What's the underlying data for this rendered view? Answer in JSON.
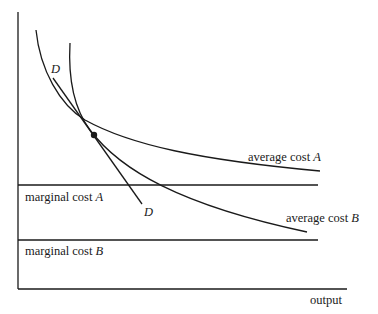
{
  "diagram": {
    "type": "economics cost curves",
    "axes": {
      "x_label": "output",
      "y_label": ""
    },
    "curves": [
      {
        "id": "average-cost-a",
        "label": "average cost",
        "suffix": "A",
        "shape": "downward-sloping convex",
        "start": [
          36,
          30
        ],
        "end": [
          320,
          171
        ]
      },
      {
        "id": "average-cost-b",
        "label": "average cost",
        "suffix": "B",
        "shape": "downward-sloping convex (steeper)",
        "start": [
          70,
          43
        ],
        "end": [
          307,
          232
        ]
      }
    ],
    "horizontal_lines": [
      {
        "id": "marginal-cost-a",
        "label": "marginal cost",
        "suffix": "A",
        "y": 185
      },
      {
        "id": "marginal-cost-b",
        "label": "marginal cost",
        "suffix": "B",
        "y": 240
      }
    ],
    "demand_line": {
      "label_top": "D",
      "label_bottom": "D",
      "start": [
        53,
        78
      ],
      "end": [
        142,
        204
      ]
    },
    "points": [
      {
        "id": "tangency-point",
        "x": 94,
        "y": 135
      }
    ],
    "colors": {
      "line": "#1a1a1a",
      "background": "#ffffff"
    }
  }
}
